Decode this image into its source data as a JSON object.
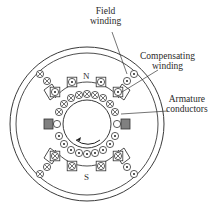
{
  "labels": {
    "field_winding": [
      "Field",
      "winding"
    ],
    "compensating_winding": [
      "Compensating",
      "winding"
    ],
    "armature_conductors": [
      "Armature",
      "conductors"
    ]
  },
  "poles": {
    "north": "N",
    "south": "S"
  },
  "symbols": {
    "dot": "current-out-of-page (⊙)",
    "cross": "current-into-page (⊗)"
  },
  "rotation": "counter-clockwise arrow inside armature",
  "colors": {
    "line": "#3a3a3a",
    "interpole": "#7a7a7a",
    "background": "#ffffff"
  }
}
